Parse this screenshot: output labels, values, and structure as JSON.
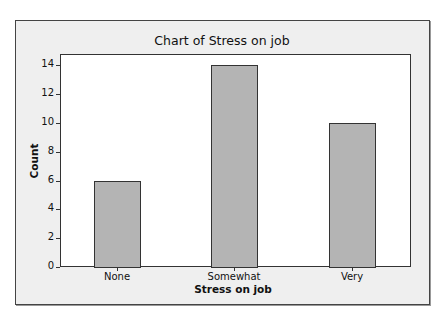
{
  "chart_data": {
    "type": "bar",
    "title": "Chart of Stress on job",
    "xlabel": "Stress on job",
    "ylabel": "Count",
    "categories": [
      "None",
      "Somewhat",
      "Very"
    ],
    "values": [
      6,
      14,
      10
    ],
    "ylim": [
      0,
      14.5
    ],
    "yticks": [
      0,
      2,
      4,
      6,
      8,
      10,
      12,
      14
    ],
    "grid": false,
    "legend": null,
    "bar_color": "#b4b4b4",
    "background_color": "#efefef"
  },
  "labels": {
    "title": "Chart of Stress on job",
    "xlabel": "Stress on job",
    "ylabel": "Count",
    "yticks": [
      "0",
      "2",
      "4",
      "6",
      "8",
      "10",
      "12",
      "14"
    ],
    "xticks": [
      "None",
      "Somewhat",
      "Very"
    ]
  }
}
